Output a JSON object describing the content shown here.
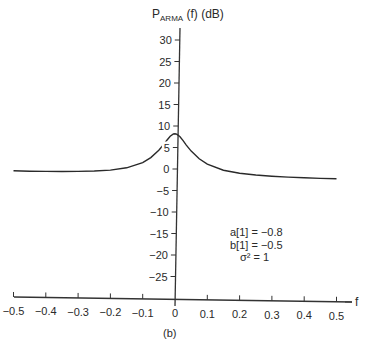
{
  "chart_data": {
    "type": "line",
    "title": "",
    "ylabel_main": "P",
    "ylabel_sub": "ARMA",
    "ylabel_rest": " (f) (dB)",
    "ylabel": "P_ARMA (f) (dB)",
    "xlabel": "f",
    "panel_label": "(b)",
    "xlim": [
      -0.5,
      0.5
    ],
    "ylim": [
      -30,
      32
    ],
    "grid": false,
    "legend": null,
    "x_ticks": [
      "-0.5",
      "-0.4",
      "-0.3",
      "-0.2",
      "-0.1",
      "0",
      "0.1",
      "0.2",
      "0.3",
      "0.4",
      "0.5"
    ],
    "x_tick_labels": [
      "−0.5",
      "−0.4",
      "−0.3",
      "−0.2",
      "−0.1",
      "0",
      "0.1",
      "0.2",
      "0.3",
      "0.4",
      "0.5"
    ],
    "y_ticks": [
      30,
      25,
      20,
      15,
      10,
      5,
      0,
      -5,
      -10,
      -15,
      -20,
      -25
    ],
    "y_tick_labels": [
      "30",
      "25",
      "20",
      "15",
      "10",
      "5",
      "0",
      "−5",
      "−10",
      "−15",
      "−20",
      "−25"
    ],
    "annotations": [
      "a[1] = −0.8",
      "b[1] = −0.5",
      "σ² = 1"
    ],
    "series": [
      {
        "name": "P_ARMA(f)",
        "x": [
          -0.5,
          -0.45,
          -0.4,
          -0.35,
          -0.3,
          -0.25,
          -0.2,
          -0.15,
          -0.1,
          -0.075,
          -0.05,
          -0.035,
          -0.025,
          -0.015,
          -0.005,
          0,
          0.005,
          0.015,
          0.025,
          0.035,
          0.05,
          0.075,
          0.1,
          0.15,
          0.2,
          0.25,
          0.3,
          0.35,
          0.4,
          0.45,
          0.5
        ],
        "values": [
          -1.58,
          -1.57,
          -1.54,
          -1.47,
          -1.36,
          -1.17,
          -0.85,
          -0.24,
          1.06,
          2.28,
          4.02,
          5.39,
          6.43,
          7.35,
          7.89,
          7.96,
          7.89,
          7.35,
          6.43,
          5.39,
          4.02,
          2.28,
          1.06,
          -0.24,
          -0.85,
          -1.17,
          -1.36,
          -1.47,
          -1.54,
          -1.57,
          -1.58
        ]
      }
    ]
  }
}
